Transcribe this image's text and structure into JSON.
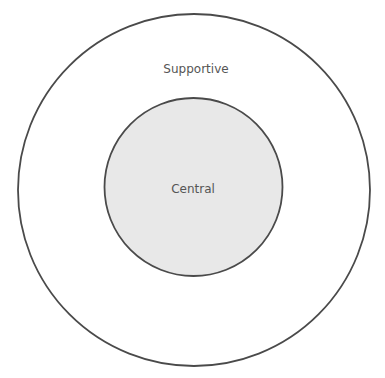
{
  "diagram": {
    "type": "concentric-circles",
    "outer": {
      "label": "Supportive",
      "fill": "#ffffff",
      "stroke": "#4a4a4a"
    },
    "inner": {
      "label": "Central",
      "fill": "#e8e8e8",
      "stroke": "#4a4a4a"
    }
  }
}
